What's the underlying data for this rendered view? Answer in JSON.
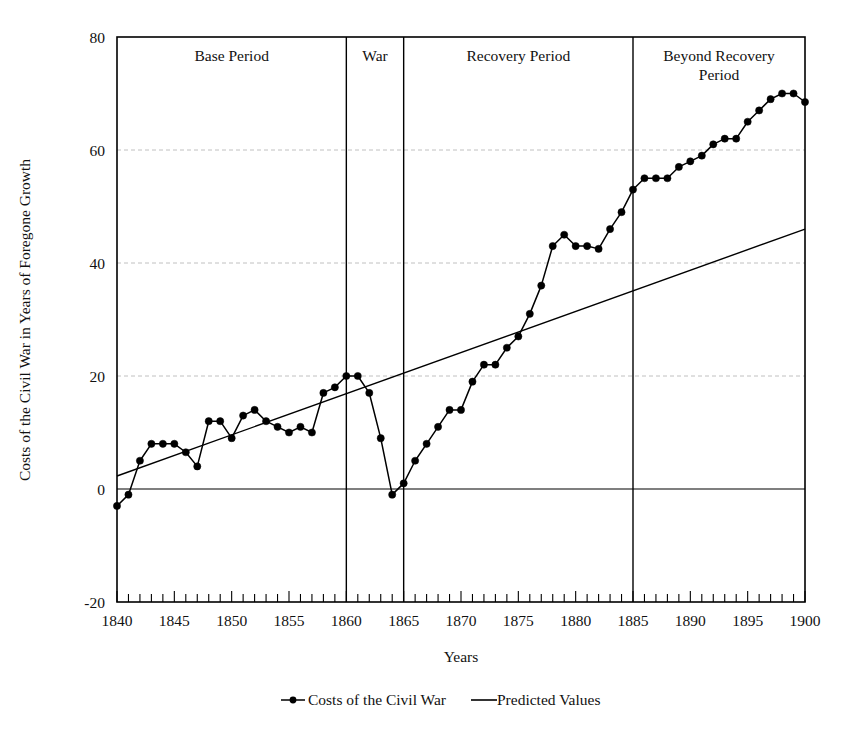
{
  "chart_data": {
    "type": "line",
    "title": "",
    "xlabel": "Years",
    "ylabel": "Costs of the Civil War in Years of Foregone Growth",
    "xlim": [
      1840,
      1900
    ],
    "ylim": [
      -20,
      80
    ],
    "ytick_labels": [
      "80",
      "60",
      "40",
      "20",
      "0",
      "-20"
    ],
    "ytick_values": [
      80,
      60,
      40,
      20,
      0,
      -20
    ],
    "xtick_labels": [
      "1840",
      "1845",
      "1850",
      "1855",
      "1860",
      "1865",
      "1870",
      "1875",
      "1880",
      "1885",
      "1890",
      "1895",
      "1900"
    ],
    "xtick_values": [
      1840,
      1845,
      1850,
      1855,
      1860,
      1865,
      1870,
      1875,
      1880,
      1885,
      1890,
      1895,
      1900
    ],
    "grid": "horizontal-dashed",
    "legend_position": "bottom",
    "x": [
      1840,
      1841,
      1842,
      1843,
      1844,
      1845,
      1846,
      1847,
      1848,
      1849,
      1850,
      1851,
      1852,
      1853,
      1854,
      1855,
      1856,
      1857,
      1858,
      1859,
      1860,
      1861,
      1862,
      1863,
      1864,
      1865,
      1866,
      1867,
      1868,
      1869,
      1870,
      1871,
      1872,
      1873,
      1874,
      1875,
      1876,
      1877,
      1878,
      1879,
      1880,
      1881,
      1882,
      1883,
      1884,
      1885,
      1886,
      1887,
      1888,
      1889,
      1890,
      1891,
      1892,
      1893,
      1894,
      1895,
      1896,
      1897,
      1898,
      1899,
      1900
    ],
    "series": [
      {
        "name": "Costs of the Civil War",
        "marker": "filled-circle",
        "values": [
          -3,
          -1,
          5,
          8,
          8,
          8,
          6.5,
          4,
          12,
          12,
          9,
          13,
          14,
          12,
          11,
          10,
          11,
          10,
          17,
          18,
          20,
          20,
          17,
          9,
          -1,
          1,
          5,
          8,
          11,
          14,
          14,
          19,
          22,
          22,
          25,
          27,
          31,
          36,
          43,
          45,
          43,
          43,
          42.5,
          46,
          49,
          53,
          55,
          55,
          55,
          57,
          58,
          59,
          61,
          62,
          62,
          65,
          67,
          69,
          70,
          70,
          68.5
        ]
      },
      {
        "name": "Predicted Values",
        "marker": "none",
        "endpoints": [
          [
            1840,
            2.3
          ],
          [
            1900,
            46.0
          ]
        ]
      }
    ],
    "annotations": [
      {
        "label": "Base Period",
        "x_start": 1840,
        "x_end": 1860
      },
      {
        "label": "War",
        "x_start": 1860,
        "x_end": 1865
      },
      {
        "label": "Recovery Period",
        "x_start": 1865,
        "x_end": 1885
      },
      {
        "label": "Beyond Recovery Period",
        "x_start": 1885,
        "x_end": 1900
      }
    ],
    "dividers": [
      1860,
      1865,
      1885
    ]
  },
  "legend": {
    "items": [
      {
        "label": "Costs of the Civil War",
        "style": "line-with-marker"
      },
      {
        "label": "Predicted Values",
        "style": "line"
      }
    ]
  },
  "colors": {
    "series": "#000000",
    "trend": "#000000",
    "grid": "#b9b9b9",
    "background": "#ffffff"
  }
}
